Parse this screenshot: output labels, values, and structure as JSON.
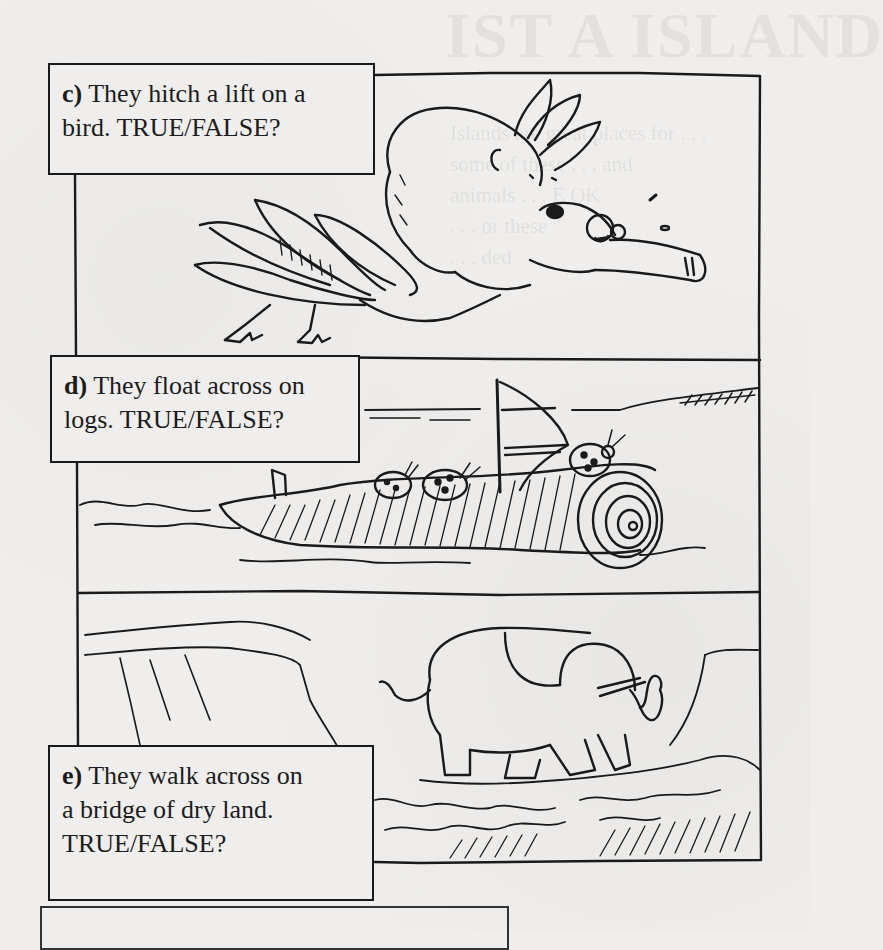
{
  "page": {
    "panels": [
      {
        "id": "c",
        "letter": "c)",
        "text_line1": " They hitch a lift on a",
        "text_line2": "bird. TRUE/FALSE?",
        "illustration": "koala-riding-flying-bird"
      },
      {
        "id": "d",
        "letter": "d)",
        "text_line1": " They float across on",
        "text_line2": "logs. TRUE/FALSE?",
        "illustration": "ladybirds-on-floating-log-with-sail"
      },
      {
        "id": "e",
        "letter": "e)",
        "text_line1": " They walk across on",
        "text_line2": "a bridge of dry land.",
        "text_line3": "TRUE/FALSE?",
        "illustration": "elephant-walking-across-land-bridge"
      }
    ],
    "bleed_through": {
      "title": "IST A ISLAND",
      "lines": [
        "Islands are great places for . . .",
        "some of these . . . and",
        "animals . . . E OK",
        ". . . or these",
        ". . . ded"
      ]
    },
    "colors": {
      "paper": "#efeeec",
      "ink": "#1a1a1a"
    }
  }
}
